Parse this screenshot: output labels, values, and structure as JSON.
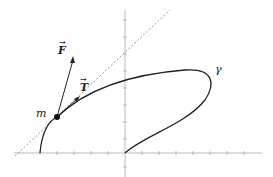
{
  "diagram": {
    "labels": {
      "force": "F",
      "tangent": "T",
      "mass": "m",
      "curve": "γ"
    },
    "colors": {
      "stroke": "#222222",
      "axis": "#999999",
      "dashed": "#777777"
    }
  }
}
